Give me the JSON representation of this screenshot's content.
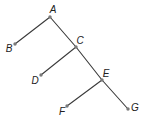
{
  "diagram": {
    "type": "tree",
    "colors": {
      "edge": "#3a3a3a",
      "node": "#7a7a7a",
      "label": "#222222",
      "background": "#ffffff"
    },
    "nodes": [
      {
        "id": "A",
        "label": "A",
        "x": 50,
        "y": 17,
        "lx": 53,
        "ly": 10
      },
      {
        "id": "B",
        "label": "B",
        "x": 15,
        "y": 44,
        "lx": 9,
        "ly": 49
      },
      {
        "id": "C",
        "label": "C",
        "x": 76,
        "y": 47,
        "lx": 80,
        "ly": 41
      },
      {
        "id": "D",
        "label": "D",
        "x": 41,
        "y": 75,
        "lx": 35,
        "ly": 81
      },
      {
        "id": "E",
        "label": "E",
        "x": 102,
        "y": 80,
        "lx": 106,
        "ly": 74
      },
      {
        "id": "F",
        "label": "F",
        "x": 67,
        "y": 106,
        "lx": 62,
        "ly": 112
      },
      {
        "id": "G",
        "label": "G",
        "x": 128,
        "y": 109,
        "lx": 135,
        "ly": 108
      }
    ],
    "edges": [
      {
        "from": "A",
        "to": "B"
      },
      {
        "from": "A",
        "to": "C"
      },
      {
        "from": "C",
        "to": "D"
      },
      {
        "from": "C",
        "to": "E"
      },
      {
        "from": "E",
        "to": "F"
      },
      {
        "from": "E",
        "to": "G"
      }
    ]
  }
}
